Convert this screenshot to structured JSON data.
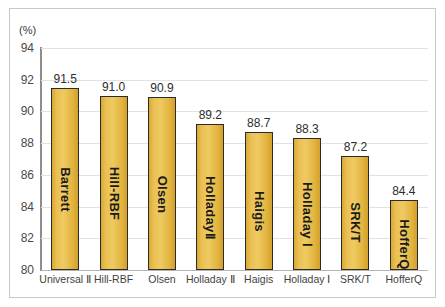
{
  "chart_data": {
    "type": "bar",
    "title": "",
    "subtitle": "",
    "xlabel": "",
    "ylabel": "",
    "unit_label": "(%)",
    "ylim": [
      80,
      94
    ],
    "ytick_labels": [
      "94",
      "92",
      "90",
      "88",
      "86",
      "84",
      "82",
      "80"
    ],
    "yticks": [
      94,
      92,
      90,
      88,
      86,
      84,
      82,
      80
    ],
    "grid": true,
    "grid_axis": "y",
    "legend": "none",
    "categories": [
      "Universal Ⅱ",
      "Hill-RBF",
      "Olsen",
      "Holladay Ⅱ",
      "Haigis",
      "Holladay Ⅰ",
      "SRK/T",
      "HofferQ"
    ],
    "bar_labels": [
      "Barrett",
      "Hill-RBF",
      "Olsen",
      "HolladayⅡ",
      "Haigis",
      "Holladay Ⅰ",
      "SRK/T",
      "HofferQ"
    ],
    "values": [
      91.5,
      91.0,
      90.9,
      89.2,
      88.7,
      88.3,
      87.2,
      84.4
    ],
    "value_labels": [
      "91.5",
      "91.0",
      "90.9",
      "89.2",
      "88.7",
      "88.3",
      "87.2",
      "84.4"
    ],
    "colors": {
      "bar_fill": "#EAC053",
      "bar_fill_dark": "#D3A02C",
      "bar_border": "#2B2B2B",
      "gridline": "#E2E2E2",
      "axis": "#8D8D8D",
      "frame": "#C9C9C9",
      "text": "#2D2D2D",
      "background": "#FFFFFF"
    }
  }
}
